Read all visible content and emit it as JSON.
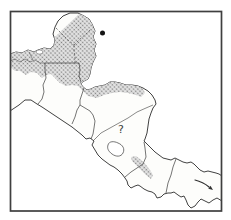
{
  "map": {
    "annotations": {
      "question_mark": "?"
    },
    "symbols": {
      "locality_dot": "filled-circle-record-marker",
      "range_arrow": "range-continues-southeast-arrow"
    },
    "colors": {
      "frame": "#3f3f3f",
      "coastline": "#2b2b2b",
      "border": "#3a3a3a",
      "state_dash": "#4a4a4a",
      "stipple_dot": "#7d7d7d",
      "stipple_base": "#e4e4e4",
      "marker": "#141414",
      "annotation": "#3c3c3c",
      "sea": "#ffffff",
      "land": "#fdfdfb"
    },
    "shaded_regions": [
      "yucatan-peninsula-gulf-lowlands",
      "belize-peten-honduras-caribbean-band",
      "central-costa-rica-band"
    ]
  }
}
